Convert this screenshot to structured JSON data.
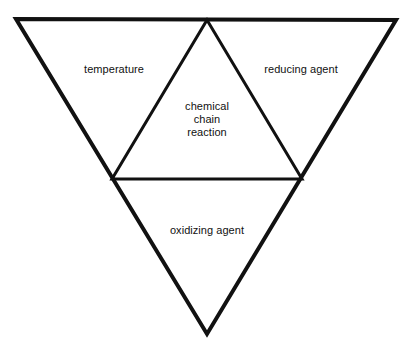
{
  "diagram": {
    "kind": "inverted-triangle-diagram",
    "canvas": {
      "width": 413,
      "height": 352,
      "background": "#ffffff"
    },
    "stroke_color": "#111111",
    "text_color": "#111111",
    "outer_triangle": {
      "name": "outer-triangle",
      "stroke_width": 4,
      "points": "16,19 396,20 207,334"
    },
    "inner_triangle": {
      "name": "inner-triangle",
      "stroke_width": 3,
      "points": "207,20 302,179 112,179"
    },
    "labels": {
      "temperature": "temperature",
      "reducing_agent": "reducing agent",
      "oxidizing_agent": "oxidizing agent",
      "chemical_chain_reaction": {
        "line1": "chemical",
        "line2": "chain",
        "line3": "reaction"
      }
    }
  }
}
